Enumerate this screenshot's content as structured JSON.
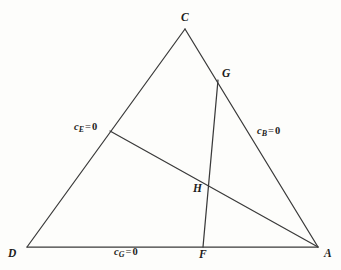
{
  "figure": {
    "type": "geometric-diagram",
    "background_color": "#fdfdfb",
    "line_color": "#3a3a3a",
    "text_color": "#1d1d1d",
    "width": 341,
    "height": 270,
    "vertices": [
      {
        "id": "C",
        "label": "C",
        "x": 185,
        "y": 29
      },
      {
        "id": "D",
        "label": "D",
        "x": 27,
        "y": 247
      },
      {
        "id": "A",
        "label": "A",
        "x": 318,
        "y": 247
      },
      {
        "id": "G",
        "label": "G",
        "x": 218,
        "y": 80
      },
      {
        "id": "E",
        "label": "E",
        "x": 110,
        "y": 131
      },
      {
        "id": "H",
        "label": "H",
        "x": 205,
        "y": 190
      },
      {
        "id": "F",
        "label": "F",
        "x": 203,
        "y": 247
      }
    ],
    "edges": [
      {
        "name": "edge-D-C",
        "from": "D",
        "to": "C"
      },
      {
        "name": "edge-C-A",
        "from": "C",
        "to": "A"
      },
      {
        "name": "edge-D-A",
        "from": "D",
        "to": "A"
      },
      {
        "name": "cevian-E-A",
        "from": "E",
        "to": "A"
      },
      {
        "name": "cevian-G-F",
        "from": "G",
        "to": "F"
      }
    ],
    "point_labels": [
      {
        "name": "vertex-label-C",
        "text": "C",
        "x": 181,
        "y": 12
      },
      {
        "name": "vertex-label-G",
        "text": "G",
        "x": 222,
        "y": 68
      },
      {
        "name": "vertex-label-H",
        "text": "H",
        "x": 193,
        "y": 183
      },
      {
        "name": "vertex-label-D",
        "text": "D",
        "x": 8,
        "y": 248
      },
      {
        "name": "vertex-label-F",
        "text": "F",
        "x": 199,
        "y": 249
      },
      {
        "name": "vertex-label-A",
        "text": "A",
        "x": 324,
        "y": 248
      }
    ],
    "equation_labels": [
      {
        "name": "constraint-label-cE",
        "symbol": "c",
        "subscript": "E",
        "operator": "=",
        "value": "0",
        "full_text": "cE = 0",
        "x": 74,
        "y": 122
      },
      {
        "name": "constraint-label-cB",
        "symbol": "c",
        "subscript": "B",
        "operator": "=",
        "value": "0",
        "full_text": "cB = 0",
        "x": 257,
        "y": 126
      },
      {
        "name": "constraint-label-cG",
        "symbol": "c",
        "subscript": "G",
        "operator": "=",
        "value": "0",
        "full_text": "cG = 0",
        "x": 114,
        "y": 247
      }
    ]
  }
}
